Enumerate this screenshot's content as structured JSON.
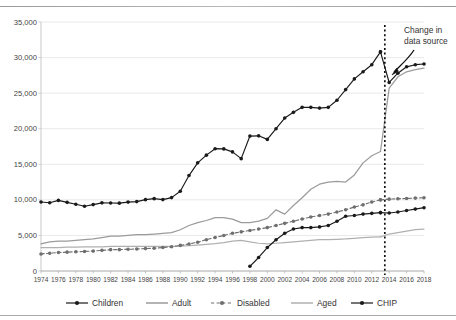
{
  "chart_data": {
    "type": "line",
    "title": "",
    "subtitle": "",
    "xlabel": "",
    "ylabel": "",
    "xlim": [
      1974,
      2018
    ],
    "ylim": [
      0,
      35000
    ],
    "grid": true,
    "grid_axis": "y",
    "legend_position": "bottom",
    "ytick_labels": [
      "0",
      "5,000",
      "10,000",
      "15,000",
      "20,000",
      "25,000",
      "30,000",
      "35,000"
    ],
    "ytick_values": [
      0,
      5000,
      10000,
      15000,
      20000,
      25000,
      30000,
      35000
    ],
    "xtick_labels": [
      "1974",
      "1976",
      "1978",
      "1980",
      "1982",
      "1984",
      "1986",
      "1988",
      "1990",
      "1992",
      "1994",
      "1996",
      "1998",
      "2000",
      "2002",
      "2004",
      "2006",
      "2008",
      "2010",
      "2012",
      "2014",
      "2016",
      "2018"
    ],
    "xtick_values": [
      1974,
      1976,
      1978,
      1980,
      1982,
      1984,
      1986,
      1988,
      1990,
      1992,
      1994,
      1996,
      1998,
      2000,
      2002,
      2004,
      2006,
      2008,
      2010,
      2012,
      2014,
      2016,
      2018
    ],
    "x": [
      1974,
      1975,
      1976,
      1977,
      1978,
      1979,
      1980,
      1981,
      1982,
      1983,
      1984,
      1985,
      1986,
      1987,
      1988,
      1989,
      1990,
      1991,
      1992,
      1993,
      1994,
      1995,
      1996,
      1997,
      1998,
      1999,
      2000,
      2001,
      2002,
      2003,
      2004,
      2005,
      2006,
      2007,
      2008,
      2009,
      2010,
      2011,
      2012,
      2013,
      2014,
      2015,
      2016,
      2017,
      2018
    ],
    "break_year": 2013.5,
    "series": [
      {
        "name": "Children",
        "color": "#1a1a1a",
        "style": "solid",
        "marker": "circle",
        "values": [
          9700,
          9600,
          9924,
          9651,
          9376,
          9106,
          9333,
          9581,
          9563,
          9535,
          9684,
          9757,
          10029,
          10168,
          10037,
          10318,
          11220,
          13415,
          15200,
          16285,
          17194,
          17164,
          16739,
          15791,
          18964,
          19000,
          18500,
          20000,
          21500,
          22300,
          23000,
          23000,
          22900,
          23000,
          24000,
          25500,
          27000,
          28000,
          29000,
          30800,
          null,
          null,
          null,
          null,
          null
        ],
        "values_post": [
          null,
          null,
          null,
          null,
          null,
          null,
          null,
          null,
          null,
          null,
          null,
          null,
          null,
          null,
          null,
          null,
          null,
          null,
          null,
          null,
          null,
          null,
          null,
          null,
          null,
          null,
          null,
          null,
          null,
          null,
          null,
          null,
          null,
          null,
          null,
          null,
          null,
          null,
          null,
          30800,
          26500,
          27800,
          28700,
          29000,
          29100
        ]
      },
      {
        "name": "Adult",
        "color": "#9b9b9b",
        "style": "solid",
        "marker": "none",
        "values": [
          3800,
          4100,
          4200,
          4200,
          4300,
          4400,
          4500,
          4700,
          4900,
          4900,
          5000,
          5100,
          5100,
          5200,
          5300,
          5400,
          5800,
          6400,
          6800,
          7100,
          7500,
          7500,
          7300,
          6800,
          6800,
          7000,
          7400,
          8600,
          8000,
          9200,
          10300,
          11500,
          12200,
          12500,
          12600,
          12500,
          13500,
          15200,
          16200,
          16800,
          null,
          null,
          null,
          null,
          null
        ],
        "values_post": [
          null,
          null,
          null,
          null,
          null,
          null,
          null,
          null,
          null,
          null,
          null,
          null,
          null,
          null,
          null,
          null,
          null,
          null,
          null,
          null,
          null,
          null,
          null,
          null,
          null,
          null,
          null,
          null,
          null,
          null,
          null,
          null,
          null,
          null,
          null,
          null,
          null,
          null,
          null,
          16800,
          25700,
          27300,
          28000,
          28300,
          28500
        ]
      },
      {
        "name": "Disabled",
        "color": "#6f6f6f",
        "style": "dashed",
        "marker": "circle",
        "values": [
          2400,
          2500,
          2600,
          2650,
          2700,
          2750,
          2800,
          2900,
          3000,
          3000,
          3050,
          3100,
          3150,
          3200,
          3300,
          3400,
          3600,
          3800,
          4050,
          4400,
          4700,
          5000,
          5300,
          5500,
          5700,
          5900,
          6100,
          6400,
          6700,
          7000,
          7300,
          7600,
          7800,
          8000,
          8300,
          8600,
          9000,
          9300,
          9700,
          10000,
          null,
          null,
          null,
          null,
          null
        ],
        "values_post": [
          null,
          null,
          null,
          null,
          null,
          null,
          null,
          null,
          null,
          null,
          null,
          null,
          null,
          null,
          null,
          null,
          null,
          null,
          null,
          null,
          null,
          null,
          null,
          null,
          null,
          null,
          null,
          null,
          null,
          null,
          null,
          null,
          null,
          null,
          null,
          null,
          null,
          null,
          null,
          10000,
          10100,
          10150,
          10200,
          10250,
          10300
        ]
      },
      {
        "name": "Aged",
        "color": "#b0b0b0",
        "style": "solid",
        "marker": "none",
        "values": [
          3300,
          3300,
          3300,
          3350,
          3350,
          3400,
          3400,
          3400,
          3450,
          3450,
          3450,
          3450,
          3450,
          3450,
          3450,
          3450,
          3500,
          3550,
          3650,
          3750,
          3850,
          4000,
          4200,
          4300,
          4100,
          3900,
          3800,
          3900,
          4000,
          4100,
          4200,
          4300,
          4400,
          4400,
          4450,
          4500,
          4600,
          4700,
          4750,
          4800,
          null,
          null,
          null,
          null,
          null
        ],
        "values_post": [
          null,
          null,
          null,
          null,
          null,
          null,
          null,
          null,
          null,
          null,
          null,
          null,
          null,
          null,
          null,
          null,
          null,
          null,
          null,
          null,
          null,
          null,
          null,
          null,
          null,
          null,
          null,
          null,
          null,
          null,
          null,
          null,
          null,
          null,
          null,
          null,
          null,
          null,
          null,
          4800,
          5200,
          5400,
          5600,
          5800,
          5900
        ]
      },
      {
        "name": "CHIP",
        "color": "#1a1a1a",
        "style": "solid",
        "marker": "circle",
        "values": [
          null,
          null,
          null,
          null,
          null,
          null,
          null,
          null,
          null,
          null,
          null,
          null,
          null,
          null,
          null,
          null,
          null,
          null,
          null,
          null,
          null,
          null,
          null,
          null,
          660,
          1900,
          3300,
          4400,
          5300,
          5900,
          6100,
          6100,
          6200,
          6400,
          7000,
          7700,
          7800,
          8000,
          8100,
          8200,
          null,
          null,
          null,
          null,
          null
        ],
        "values_post": [
          null,
          null,
          null,
          null,
          null,
          null,
          null,
          null,
          null,
          null,
          null,
          null,
          null,
          null,
          null,
          null,
          null,
          null,
          null,
          null,
          null,
          null,
          null,
          null,
          null,
          null,
          null,
          null,
          null,
          null,
          null,
          null,
          null,
          null,
          null,
          null,
          null,
          null,
          null,
          8200,
          8150,
          8300,
          8500,
          8700,
          8900
        ]
      }
    ],
    "annotations": [
      {
        "name": "change-in-data-source",
        "line1": "Change in",
        "line2": "data source",
        "kind": "text-with-arrow",
        "target_year": 2013.5
      }
    ],
    "legend": [
      {
        "label": "Children",
        "color": "#1a1a1a",
        "style": "solid",
        "marker": "circle"
      },
      {
        "label": "Adult",
        "color": "#9b9b9b",
        "style": "solid",
        "marker": "none"
      },
      {
        "label": "Disabled",
        "color": "#6f6f6f",
        "style": "dashed",
        "marker": "circle"
      },
      {
        "label": "Aged",
        "color": "#b0b0b0",
        "style": "solid",
        "marker": "none"
      },
      {
        "label": "CHIP",
        "color": "#1a1a1a",
        "style": "solid",
        "marker": "circle"
      }
    ]
  }
}
